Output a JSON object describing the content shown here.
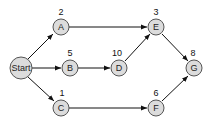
{
  "diagram": {
    "type": "network-graph",
    "nodes": [
      {
        "id": "start",
        "label": "Start",
        "weight": ""
      },
      {
        "id": "A",
        "label": "A",
        "weight": "2"
      },
      {
        "id": "B",
        "label": "B",
        "weight": "5"
      },
      {
        "id": "C",
        "label": "C",
        "weight": "1"
      },
      {
        "id": "D",
        "label": "D",
        "weight": "10"
      },
      {
        "id": "E",
        "label": "E",
        "weight": "3"
      },
      {
        "id": "F",
        "label": "F",
        "weight": "6"
      },
      {
        "id": "G",
        "label": "G",
        "weight": "8"
      }
    ],
    "edges": [
      {
        "from": "Start",
        "to": "A"
      },
      {
        "from": "Start",
        "to": "B"
      },
      {
        "from": "Start",
        "to": "C"
      },
      {
        "from": "A",
        "to": "E"
      },
      {
        "from": "B",
        "to": "D"
      },
      {
        "from": "D",
        "to": "E"
      },
      {
        "from": "E",
        "to": "G"
      },
      {
        "from": "C",
        "to": "F"
      },
      {
        "from": "F",
        "to": "G"
      }
    ]
  }
}
